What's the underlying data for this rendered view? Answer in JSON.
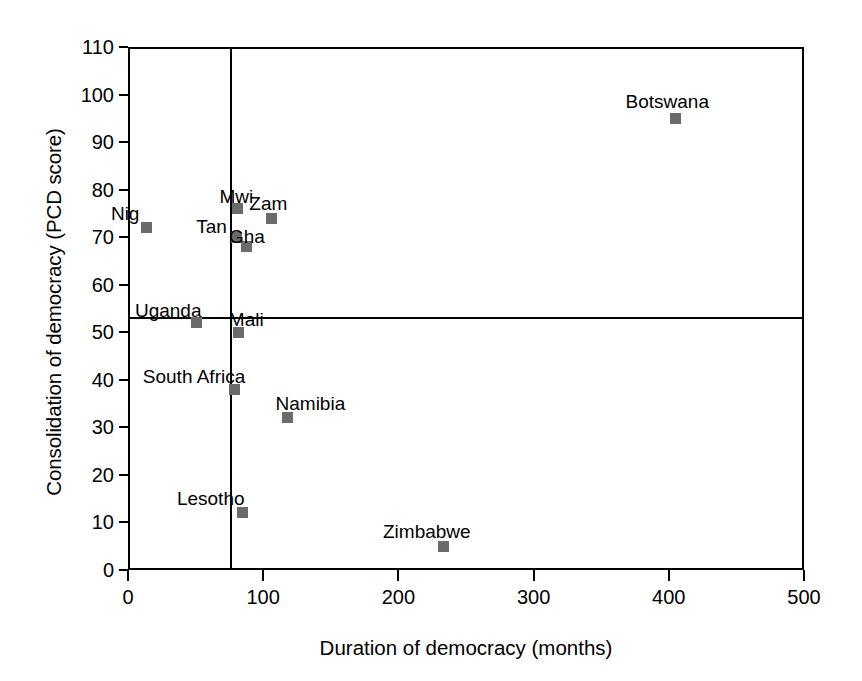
{
  "chart_data": {
    "type": "scatter",
    "title": "",
    "xlabel": "Duration of democracy (months)",
    "ylabel": "Consolidation of democracy (PCD score)",
    "xlim": [
      0,
      500
    ],
    "ylim": [
      0,
      110
    ],
    "xticks": [
      0,
      100,
      200,
      300,
      400,
      500
    ],
    "yticks": [
      0,
      10,
      20,
      30,
      40,
      50,
      60,
      70,
      80,
      90,
      100,
      110
    ],
    "grid": false,
    "legend": null,
    "reference_lines": [
      {
        "orientation": "vertical",
        "value": 76,
        "axis": "x"
      },
      {
        "orientation": "horizontal",
        "value": 53,
        "axis": "y"
      }
    ],
    "points": [
      {
        "label": "Nig",
        "x": 14,
        "y": 72
      },
      {
        "label": "Mwi",
        "x": 81,
        "y": 76
      },
      {
        "label": "Zam",
        "x": 106,
        "y": 74
      },
      {
        "label": "Tan",
        "x": 80,
        "y": 70
      },
      {
        "label": "Gha",
        "x": 88,
        "y": 68
      },
      {
        "label": "Uganda",
        "x": 51,
        "y": 52
      },
      {
        "label": "Mali",
        "x": 82,
        "y": 50
      },
      {
        "label": "South Africa",
        "x": 79,
        "y": 38
      },
      {
        "label": "Namibia",
        "x": 118,
        "y": 32
      },
      {
        "label": "Lesotho",
        "x": 85,
        "y": 12
      },
      {
        "label": "Zimbabwe",
        "x": 233,
        "y": 5
      },
      {
        "label": "Botswana",
        "x": 405,
        "y": 95
      }
    ],
    "label_offsets": {
      "Nig": {
        "dx": -36,
        "dy": -24
      },
      "Mwi": {
        "dx": -18,
        "dy": -22
      },
      "Zam": {
        "dx": -22,
        "dy": -24
      },
      "Tan": {
        "dx": -40,
        "dy": -20
      },
      "Gha": {
        "dx": -18,
        "dy": -20
      },
      "Uganda": {
        "dx": -62,
        "dy": -22
      },
      "Mali": {
        "dx": -10,
        "dy": -22
      },
      "South Africa": {
        "dx": -92,
        "dy": -22
      },
      "Namibia": {
        "dx": -12,
        "dy": -24
      },
      "Lesotho": {
        "dx": -66,
        "dy": -24
      },
      "Zimbabwe": {
        "dx": -60,
        "dy": -24
      },
      "Botswana": {
        "dx": -50,
        "dy": -26
      }
    },
    "marker_color": "#6b6b6b",
    "axis_color": "#000000",
    "background": "#ffffff"
  }
}
